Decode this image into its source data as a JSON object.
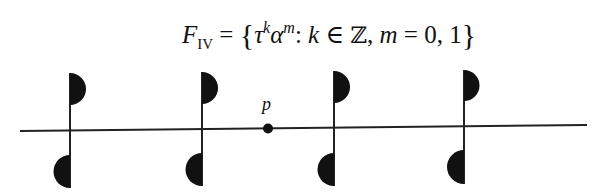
{
  "formula": {
    "lhs": "F",
    "lhs_subscript": "IV",
    "equals": " = ",
    "open_brace": "{",
    "tau": "τ",
    "tau_exp": "k",
    "alpha": "α",
    "alpha_exp": "m",
    "colon": ": ",
    "k": "k",
    "in": " ∈ ",
    "integers": "ℤ",
    "comma1": ", ",
    "m": "m",
    "equals2": " = ",
    "values": "0, 1",
    "close_brace": "}"
  },
  "diagram": {
    "line": {
      "x1": 20,
      "y1": 131,
      "x2": 587,
      "y2": 125,
      "color": "#222222"
    },
    "point": {
      "label": "p",
      "cx": 268,
      "cy": 128.5,
      "r": 5
    },
    "motifs": [
      {
        "x": 70,
        "top": [
          73,
          105
        ],
        "bottom": [
          155,
          188
        ]
      },
      {
        "x": 202,
        "top": [
          72,
          104
        ],
        "bottom": [
          153,
          186
        ]
      },
      {
        "x": 334,
        "top": [
          71,
          103
        ],
        "bottom": [
          153,
          186
        ]
      },
      {
        "x": 464,
        "top": [
          70,
          100
        ],
        "bottom": [
          150,
          184
        ]
      }
    ],
    "fill_color": "#111111"
  }
}
